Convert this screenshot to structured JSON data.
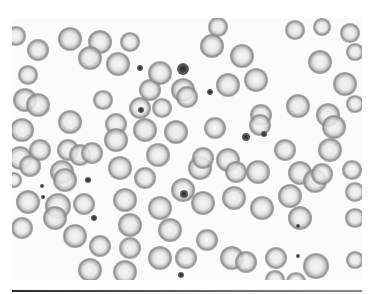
{
  "figure": {
    "image_region": {
      "x": 12,
      "y": 18,
      "width": 350,
      "height": 260
    },
    "colors": {
      "background": "#fbfbfb",
      "cell_ring": "#8c8c8c",
      "cell_fill": "#dcdcdc",
      "cell_center": "#f2f2f2",
      "dark_dot": "#2e2e2e",
      "rule": "#3a3a3a"
    },
    "cells": [
      {
        "cx": 16,
        "cy": 36,
        "r": 9
      },
      {
        "cx": 38,
        "cy": 50,
        "r": 10
      },
      {
        "cx": 70,
        "cy": 39,
        "r": 11
      },
      {
        "cx": 100,
        "cy": 42,
        "r": 11
      },
      {
        "cx": 130,
        "cy": 42,
        "r": 9
      },
      {
        "cx": 90,
        "cy": 58,
        "r": 11
      },
      {
        "cx": 118,
        "cy": 64,
        "r": 11
      },
      {
        "cx": 28,
        "cy": 75,
        "r": 9
      },
      {
        "cx": 25,
        "cy": 100,
        "r": 11
      },
      {
        "cx": 38,
        "cy": 105,
        "r": 11
      },
      {
        "cx": 103,
        "cy": 100,
        "r": 9
      },
      {
        "cx": 22,
        "cy": 130,
        "r": 11
      },
      {
        "cx": 70,
        "cy": 122,
        "r": 11
      },
      {
        "cx": 116,
        "cy": 124,
        "r": 10
      },
      {
        "cx": 116,
        "cy": 140,
        "r": 11
      },
      {
        "cx": 150,
        "cy": 90,
        "r": 10
      },
      {
        "cx": 160,
        "cy": 73,
        "r": 11
      },
      {
        "cx": 183,
        "cy": 90,
        "r": 11
      },
      {
        "cx": 187,
        "cy": 97,
        "r": 10
      },
      {
        "cx": 162,
        "cy": 108,
        "r": 9
      },
      {
        "cx": 140,
        "cy": 108,
        "r": 10
      },
      {
        "cx": 145,
        "cy": 130,
        "r": 11
      },
      {
        "cx": 176,
        "cy": 132,
        "r": 11
      },
      {
        "cx": 212,
        "cy": 46,
        "r": 11
      },
      {
        "cx": 218,
        "cy": 27,
        "r": 9
      },
      {
        "cx": 242,
        "cy": 56,
        "r": 11
      },
      {
        "cx": 228,
        "cy": 85,
        "r": 11
      },
      {
        "cx": 256,
        "cy": 80,
        "r": 11
      },
      {
        "cx": 261,
        "cy": 115,
        "r": 10
      },
      {
        "cx": 260,
        "cy": 125,
        "r": 10
      },
      {
        "cx": 215,
        "cy": 128,
        "r": 10
      },
      {
        "cx": 295,
        "cy": 30,
        "r": 9
      },
      {
        "cx": 322,
        "cy": 27,
        "r": 8
      },
      {
        "cx": 350,
        "cy": 33,
        "r": 9
      },
      {
        "cx": 355,
        "cy": 52,
        "r": 8
      },
      {
        "cx": 320,
        "cy": 62,
        "r": 11
      },
      {
        "cx": 345,
        "cy": 84,
        "r": 11
      },
      {
        "cx": 298,
        "cy": 106,
        "r": 11
      },
      {
        "cx": 328,
        "cy": 115,
        "r": 11
      },
      {
        "cx": 334,
        "cy": 127,
        "r": 11
      },
      {
        "cx": 355,
        "cy": 104,
        "r": 8
      },
      {
        "cx": 20,
        "cy": 158,
        "r": 11
      },
      {
        "cx": 30,
        "cy": 166,
        "r": 10
      },
      {
        "cx": 40,
        "cy": 150,
        "r": 10
      },
      {
        "cx": 68,
        "cy": 150,
        "r": 10
      },
      {
        "cx": 80,
        "cy": 155,
        "r": 10
      },
      {
        "cx": 92,
        "cy": 153,
        "r": 10
      },
      {
        "cx": 62,
        "cy": 172,
        "r": 11
      },
      {
        "cx": 65,
        "cy": 180,
        "r": 11
      },
      {
        "cx": 14,
        "cy": 180,
        "r": 7
      },
      {
        "cx": 28,
        "cy": 202,
        "r": 11
      },
      {
        "cx": 58,
        "cy": 206,
        "r": 12
      },
      {
        "cx": 55,
        "cy": 218,
        "r": 11
      },
      {
        "cx": 22,
        "cy": 228,
        "r": 10
      },
      {
        "cx": 84,
        "cy": 204,
        "r": 10
      },
      {
        "cx": 75,
        "cy": 236,
        "r": 11
      },
      {
        "cx": 100,
        "cy": 246,
        "r": 10
      },
      {
        "cx": 90,
        "cy": 270,
        "r": 11
      },
      {
        "cx": 120,
        "cy": 168,
        "r": 11
      },
      {
        "cx": 125,
        "cy": 200,
        "r": 11
      },
      {
        "cx": 130,
        "cy": 225,
        "r": 11
      },
      {
        "cx": 145,
        "cy": 178,
        "r": 10
      },
      {
        "cx": 158,
        "cy": 155,
        "r": 11
      },
      {
        "cx": 160,
        "cy": 208,
        "r": 11
      },
      {
        "cx": 170,
        "cy": 230,
        "r": 11
      },
      {
        "cx": 130,
        "cy": 248,
        "r": 10
      },
      {
        "cx": 160,
        "cy": 258,
        "r": 11
      },
      {
        "cx": 125,
        "cy": 272,
        "r": 11
      },
      {
        "cx": 183,
        "cy": 190,
        "r": 11
      },
      {
        "cx": 200,
        "cy": 168,
        "r": 11
      },
      {
        "cx": 203,
        "cy": 158,
        "r": 10
      },
      {
        "cx": 207,
        "cy": 240,
        "r": 10
      },
      {
        "cx": 203,
        "cy": 203,
        "r": 11
      },
      {
        "cx": 186,
        "cy": 258,
        "r": 10
      },
      {
        "cx": 228,
        "cy": 160,
        "r": 11
      },
      {
        "cx": 236,
        "cy": 172,
        "r": 10
      },
      {
        "cx": 234,
        "cy": 198,
        "r": 11
      },
      {
        "cx": 258,
        "cy": 172,
        "r": 11
      },
      {
        "cx": 262,
        "cy": 208,
        "r": 11
      },
      {
        "cx": 232,
        "cy": 258,
        "r": 11
      },
      {
        "cx": 246,
        "cy": 262,
        "r": 10
      },
      {
        "cx": 285,
        "cy": 150,
        "r": 10
      },
      {
        "cx": 300,
        "cy": 173,
        "r": 11
      },
      {
        "cx": 315,
        "cy": 181,
        "r": 11
      },
      {
        "cx": 290,
        "cy": 196,
        "r": 11
      },
      {
        "cx": 300,
        "cy": 218,
        "r": 11
      },
      {
        "cx": 322,
        "cy": 174,
        "r": 10
      },
      {
        "cx": 330,
        "cy": 150,
        "r": 11
      },
      {
        "cx": 352,
        "cy": 170,
        "r": 9
      },
      {
        "cx": 355,
        "cy": 192,
        "r": 9
      },
      {
        "cx": 355,
        "cy": 218,
        "r": 9
      },
      {
        "cx": 276,
        "cy": 258,
        "r": 10
      },
      {
        "cx": 316,
        "cy": 266,
        "r": 12
      },
      {
        "cx": 355,
        "cy": 260,
        "r": 8
      },
      {
        "cx": 275,
        "cy": 280,
        "r": 9
      },
      {
        "cx": 296,
        "cy": 282,
        "r": 9
      }
    ],
    "dots": [
      {
        "cx": 183,
        "cy": 69,
        "r": 6
      },
      {
        "cx": 210,
        "cy": 92,
        "r": 3
      },
      {
        "cx": 140,
        "cy": 68,
        "r": 3
      },
      {
        "cx": 141,
        "cy": 110,
        "r": 3
      },
      {
        "cx": 246,
        "cy": 137,
        "r": 4
      },
      {
        "cx": 264,
        "cy": 134,
        "r": 3
      },
      {
        "cx": 88,
        "cy": 180,
        "r": 3
      },
      {
        "cx": 42,
        "cy": 186,
        "r": 2
      },
      {
        "cx": 43,
        "cy": 197,
        "r": 2
      },
      {
        "cx": 94,
        "cy": 218,
        "r": 3
      },
      {
        "cx": 181,
        "cy": 275,
        "r": 3
      },
      {
        "cx": 298,
        "cy": 226,
        "r": 2
      },
      {
        "cx": 184,
        "cy": 194,
        "r": 4
      },
      {
        "cx": 298,
        "cy": 256,
        "r": 2
      }
    ]
  }
}
